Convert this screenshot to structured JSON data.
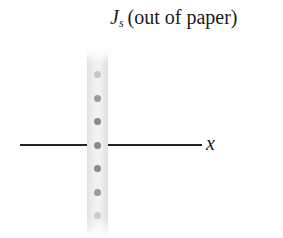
{
  "title": {
    "symbol": "J",
    "subscript": "s",
    "text": "(out of paper)"
  },
  "axis": {
    "label": "x"
  },
  "strip": {
    "dots": [
      {
        "y": 74,
        "color": "#c8c8c8"
      },
      {
        "y": 98,
        "color": "#9a9a9a"
      },
      {
        "y": 121,
        "color": "#8a8a8a"
      },
      {
        "y": 145,
        "color": "#8a8a8a"
      },
      {
        "y": 168,
        "color": "#8a8a8a"
      },
      {
        "y": 192,
        "color": "#9a9a9a"
      },
      {
        "y": 215,
        "color": "#cccccc"
      }
    ]
  }
}
